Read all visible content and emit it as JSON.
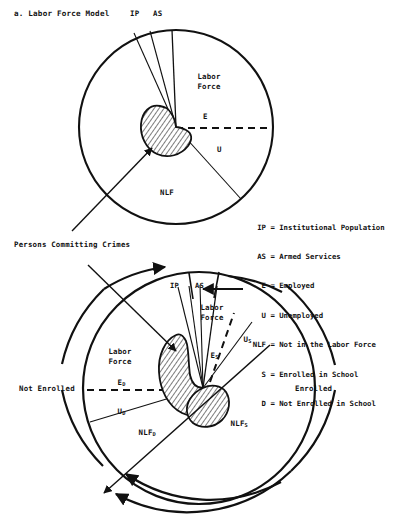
{
  "figure": {
    "title": "a. Labor Force Model",
    "caption_partial": ""
  },
  "top_circle": {
    "labels": {
      "ip": "IP",
      "as": "AS",
      "labor_force": "Labor\nForce",
      "employed": "E",
      "unemployed": "U",
      "nlf": "NLF"
    }
  },
  "annotation": {
    "persons_committing_crimes": "Persons Committing Crimes"
  },
  "legend": {
    "entries": [
      {
        "key": "IP",
        "eq": "=",
        "text": "Institutional Population"
      },
      {
        "key": "AS",
        "eq": "=",
        "text": "Armed Services"
      },
      {
        "key": "E",
        "eq": "=",
        "text": "Employed"
      },
      {
        "key": "U",
        "eq": "=",
        "text": "Unemployed"
      },
      {
        "key": "NLF",
        "eq": "=",
        "text": "Not in the Labor Force"
      },
      {
        "key": "S",
        "eq": "=",
        "text": "Enrolled in School"
      },
      {
        "key": "D",
        "eq": "=",
        "text": "Not Enrolled in School"
      }
    ]
  },
  "bottom_circle": {
    "labels": {
      "ip": "IP",
      "as": "AS",
      "labor_force_right": "Labor\nForce",
      "labor_force_left": "Labor\nForce",
      "e_s_base": "E",
      "e_s_sub": "S",
      "u_s_base": "U",
      "u_s_sub": "S",
      "nlf_s_base": "NLF",
      "nlf_s_sub": "S",
      "e_d_base": "E",
      "e_d_sub": "D",
      "u_d_base": "U",
      "u_d_sub": "D",
      "nlf_d_base": "NLF",
      "nlf_d_sub": "D",
      "not_enrolled": "Not Enrolled",
      "enrolled": "Enrolled"
    }
  },
  "colors": {
    "ink": "#111111",
    "paper": "#ffffff"
  }
}
